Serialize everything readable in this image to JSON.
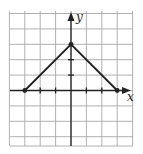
{
  "chart_data": {
    "type": "line",
    "title": "",
    "xlabel": "x",
    "ylabel": "y",
    "xlim": [
      -4,
      4
    ],
    "ylim": [
      -3.5,
      5
    ],
    "grid": true,
    "x_ticks": [
      -2,
      -1,
      1,
      2
    ],
    "y_ticks": [
      1,
      2
    ],
    "series": [
      {
        "name": "piecewise linear (inverted V)",
        "points": [
          [
            -3,
            0
          ],
          [
            0,
            3
          ],
          [
            3,
            0
          ]
        ],
        "endpoint_markers": [
          [
            -3,
            0
          ],
          [
            0,
            3
          ],
          [
            3,
            0
          ]
        ]
      }
    ],
    "colors": {
      "line": "#222222",
      "grid": "#a8a8a8",
      "axis": "#222222"
    }
  },
  "labels": {
    "x_axis": "x",
    "y_axis": "y"
  }
}
